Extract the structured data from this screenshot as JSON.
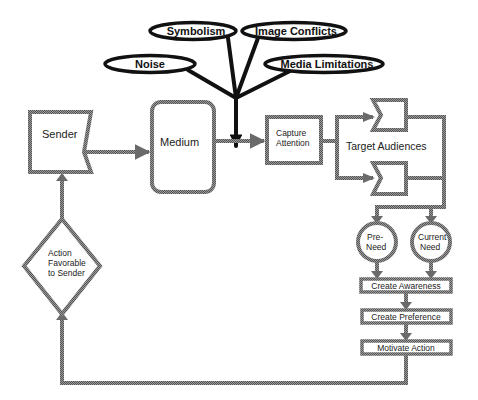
{
  "diagram": {
    "line_color": "#8a8a8a",
    "ink_color": "#111111",
    "interference": {
      "noise": "Noise",
      "symbolism": "Symbolism",
      "image_conflicts": "Image Conflicts",
      "media_limitations": "Media Limitations"
    },
    "nodes": {
      "sender": "Sender",
      "medium": "Medium",
      "capture_line1": "Capture",
      "capture_line2": "Attention",
      "target_audiences": "Target Audiences",
      "pre_need_line1": "Pre-",
      "pre_need_line2": "Need",
      "current_need_line1": "Current",
      "current_need_line2": "Need",
      "create_awareness": "Create Awareness",
      "create_preference": "Create Preference",
      "motivate_action": "Motivate Action",
      "action_line1": "Action",
      "action_line2": "Favorable",
      "action_line3": "to Sender"
    }
  }
}
